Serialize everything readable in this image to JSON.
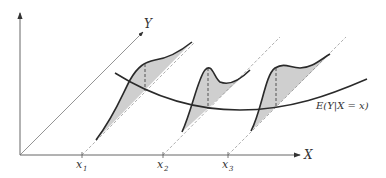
{
  "diagram": {
    "axes": {
      "x_label": "X",
      "y_label": "Y"
    },
    "x_ticks": [
      {
        "label": "x",
        "sub": "1"
      },
      {
        "label": "x",
        "sub": "2"
      },
      {
        "label": "x",
        "sub": "3"
      }
    ],
    "regression_label": "E(Y|X = x)",
    "colors": {
      "line": "#2a2a2a",
      "fill": "#cfcfcf"
    }
  }
}
